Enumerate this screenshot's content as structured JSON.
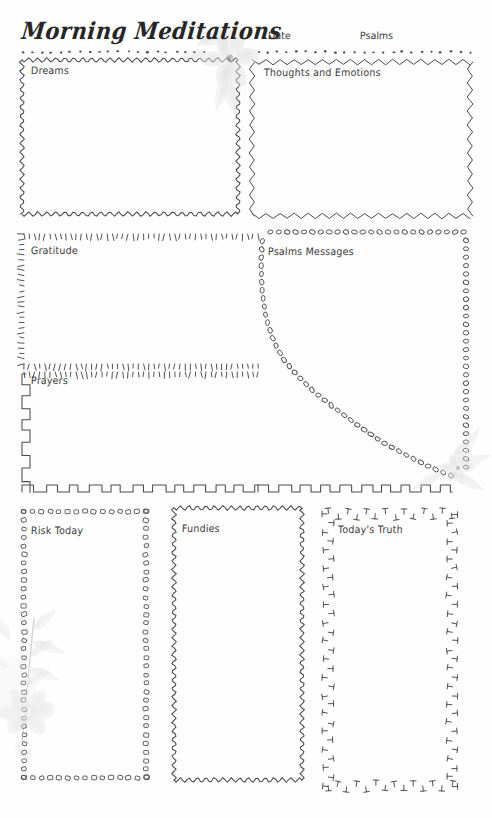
{
  "page": {
    "title": "Morning Meditations",
    "width": 492,
    "height": 818,
    "background": "#fefefe",
    "ink": "#3a3a3a"
  },
  "header": {
    "title": "Morning Meditations",
    "fields": [
      {
        "label": "Date"
      },
      {
        "label": "Psalms"
      }
    ],
    "divider_style": "dotted"
  },
  "sections": [
    {
      "id": "dreams",
      "label": "Dreams",
      "border_style": "wavy",
      "row": "top",
      "column": "left"
    },
    {
      "id": "thoughts-and-emotions",
      "label": "Thoughts and Emotions",
      "border_style": "zigzag",
      "row": "top",
      "column": "right"
    },
    {
      "id": "gratitude",
      "label": "Gratitude",
      "border_style": "tick-dash",
      "row": "middle",
      "column": "left"
    },
    {
      "id": "psalms-messages",
      "label": "Psalms Messages",
      "border_style": "oval-bead",
      "row": "middle",
      "column": "right"
    },
    {
      "id": "prayers",
      "label": "Prayers",
      "border_style": "castellated",
      "row": "middle-lower",
      "column": "left"
    },
    {
      "id": "risk-today",
      "label": "Risk Today",
      "border_style": "square-bead",
      "row": "bottom",
      "column": "left"
    },
    {
      "id": "fundies",
      "label": "Fundies",
      "border_style": "wavy",
      "row": "bottom",
      "column": "center"
    },
    {
      "id": "todays-truth",
      "label": "Today's Truth",
      "border_style": "t-mark",
      "row": "bottom",
      "column": "right"
    }
  ],
  "decorations": [
    {
      "name": "flower-top-center",
      "type": "watercolor-flower",
      "tone": "#b9b9b9"
    },
    {
      "name": "flower-right-middle",
      "type": "watercolor-flower",
      "tone": "#bdbdbd"
    },
    {
      "name": "flower-bottom-left",
      "type": "watercolor-botanical",
      "tone": "#b5b5b5"
    }
  ]
}
